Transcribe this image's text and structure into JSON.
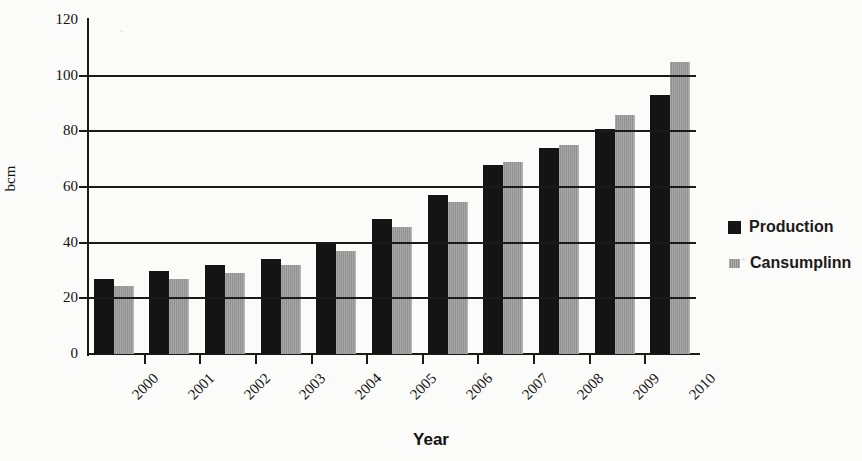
{
  "chart_data": {
    "type": "bar",
    "title": "",
    "xlabel": "Year",
    "ylabel": "bcm",
    "categories": [
      "2000",
      "2001",
      "2002",
      "2003",
      "2004",
      "2005",
      "2006",
      "2007",
      "2008",
      "2009",
      "2010"
    ],
    "series": [
      {
        "name": "Production",
        "color": "#141414",
        "values": [
          27,
          30,
          32,
          34,
          39.5,
          48.5,
          57,
          68,
          74,
          81,
          93
        ]
      },
      {
        "name": "Cansumplinn",
        "color": "#9a9a9a",
        "values": [
          24.5,
          27,
          29,
          32,
          37,
          45.5,
          54.5,
          69,
          75,
          86,
          105
        ]
      }
    ],
    "ylim": [
      0,
      120
    ],
    "yticks": [
      0,
      20,
      40,
      60,
      80,
      100,
      120
    ],
    "ytick_labels": [
      "0",
      "20",
      "40",
      "60",
      "80",
      "100",
      "120"
    ],
    "grid": "horizontal",
    "legend_position": "right"
  },
  "legend": {
    "items": [
      {
        "label": "Production",
        "swatch": "black-square-icon"
      },
      {
        "label": "Cansumplinn",
        "swatch": "gray-square-icon"
      }
    ]
  },
  "axes": {
    "x_title": "Year",
    "y_title": "bcm"
  }
}
